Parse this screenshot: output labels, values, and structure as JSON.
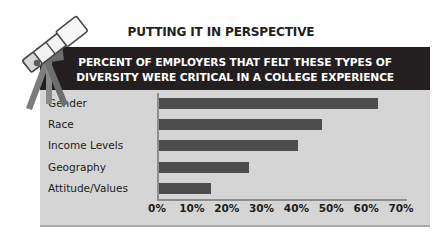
{
  "heading": "PUTTING IT IN PERSPECTIVE",
  "illustration": {
    "name": "telescope-illustration",
    "alt": "telescope-on-tripod"
  },
  "banner": {
    "line1": "PERCENT OF EMPLOYERS THAT FELT THESE TYPES OF",
    "line2": "DIVERSITY WERE CRITICAL IN A COLLEGE EXPERIENCE"
  },
  "colors": {
    "banner_background": "#231f20",
    "banner_text": "#ffffff",
    "panel_background": "#d5d5d5",
    "bar": "#4d4d4d",
    "axis": "#8d8d8d",
    "heading_text": "#231f20",
    "page_background": "#ffffff"
  },
  "chart_data": {
    "type": "bar",
    "orientation": "horizontal",
    "title": "PERCENT OF EMPLOYERS THAT FELT THESE TYPES OF DIVERSITY WERE CRITICAL IN A COLLEGE EXPERIENCE",
    "xlabel": "",
    "ylabel": "",
    "categories": [
      "Gender",
      "Race",
      "Income Levels",
      "Geography",
      "Attitude/Values"
    ],
    "values": [
      63,
      47,
      40,
      26,
      15
    ],
    "xlim": [
      0,
      70
    ],
    "xticks": [
      0,
      10,
      20,
      30,
      40,
      50,
      60,
      70
    ],
    "xtick_labels": [
      "0%",
      "10%",
      "20%",
      "30%",
      "40%",
      "50%",
      "60%",
      "70%"
    ],
    "grid": false,
    "legend": false,
    "bar_color": "#4d4d4d"
  }
}
